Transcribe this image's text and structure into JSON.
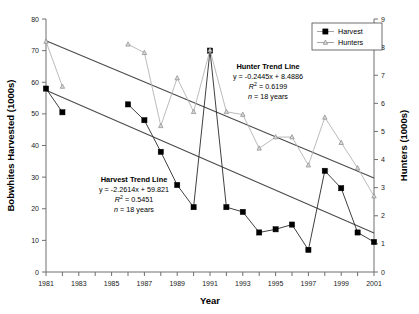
{
  "chart_data": {
    "type": "line",
    "title": "",
    "xlabel": "Year",
    "ylabel": "Bobwhites Harvested (1000s)",
    "y2label": "Hunters (1000s)",
    "xlim": [
      1981,
      2001
    ],
    "ylim": [
      0,
      80
    ],
    "y2lim": [
      0,
      9
    ],
    "ytick_step": 10,
    "y2tick_step": 1,
    "xtick_step": 1,
    "xlabel_step": 2,
    "grid": false,
    "legend_position": "top-right",
    "x_ticklabels": [
      "1981",
      "1983",
      "1985",
      "1987",
      "1989",
      "1991",
      "1993",
      "1995",
      "1997",
      "1999",
      "2001"
    ],
    "y_ticklabels": [
      "0",
      "10",
      "20",
      "30",
      "40",
      "50",
      "60",
      "70",
      "80"
    ],
    "y2_ticklabels": [
      "0",
      "1",
      "2",
      "3",
      "4",
      "5",
      "6",
      "7",
      "8",
      "9"
    ],
    "x": [
      1981,
      1982,
      1986,
      1987,
      1988,
      1989,
      1990,
      1991,
      1992,
      1993,
      1994,
      1995,
      1996,
      1997,
      1998,
      1999,
      2000,
      2001
    ],
    "series": [
      {
        "name": "Harvest",
        "axis": "left",
        "marker": "filled-square",
        "color": "#000000",
        "values": [
          58.0,
          50.5,
          53.0,
          48.0,
          38.0,
          27.5,
          20.5,
          70.0,
          20.5,
          19.0,
          12.5,
          13.5,
          15.0,
          7.0,
          32.0,
          26.5,
          12.5,
          9.5
        ]
      },
      {
        "name": "Hunters",
        "axis": "right",
        "marker": "open-triangle",
        "color": "#b3b3b3",
        "values": [
          8.2,
          6.6,
          8.1,
          7.8,
          5.2,
          6.9,
          5.7,
          7.9,
          5.7,
          5.6,
          4.4,
          4.8,
          4.8,
          3.8,
          5.5,
          4.6,
          3.7,
          2.7
        ]
      }
    ],
    "annotations": [
      {
        "name": "harvest-trend-annotation",
        "title": "Harvest Trend Line",
        "equation": "y = -2.2614x + 59.821",
        "r2_symbol": "R",
        "r2_exponent": "2",
        "r2_value": " = 0.5451",
        "n_symbol": "n",
        "n_value": " = 18 years"
      },
      {
        "name": "hunter-trend-annotation",
        "title": "Hunter Trend Line",
        "equation": "y = -0.2445x + 8.4886",
        "r2_symbol": "R",
        "r2_exponent": "2",
        "r2_value": " = 0.6199",
        "n_symbol": "n",
        "n_value": " = 18 years"
      }
    ],
    "trendlines": [
      {
        "name": "harvest-trend-line",
        "axis": "left",
        "x_start": 1981,
        "y_start": 57.5,
        "x_end": 2001,
        "y_end": 12.3
      },
      {
        "name": "hunter-trend-line",
        "axis": "right",
        "x_start": 1981,
        "y_start": 8.23,
        "x_end": 2001,
        "y_end": 3.34
      }
    ],
    "legend": [
      {
        "label": "Harvest",
        "marker": "filled-square"
      },
      {
        "label": "Hunters",
        "marker": "open-triangle"
      }
    ]
  }
}
